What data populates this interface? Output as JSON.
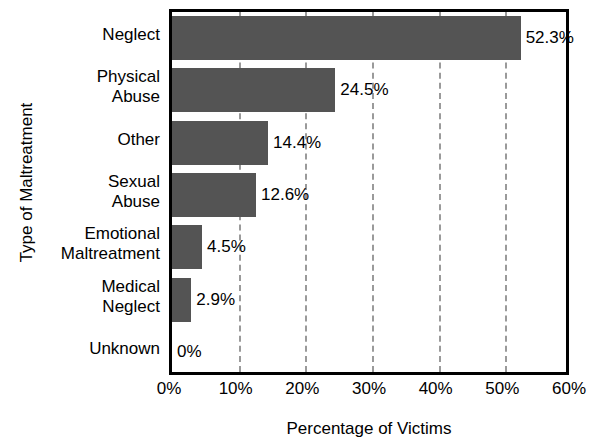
{
  "chart_data": {
    "type": "bar",
    "orientation": "horizontal",
    "title": "",
    "xlabel": "Percentage of Victims",
    "ylabel": "Type of Maltreatment",
    "categories": [
      "Neglect",
      "Physical Abuse",
      "Other",
      "Sexual Abuse",
      "Emotional Maltreatment",
      "Medical Neglect",
      "Unknown"
    ],
    "category_lines": [
      [
        "Neglect"
      ],
      [
        "Physical",
        "Abuse"
      ],
      [
        "Other"
      ],
      [
        "Sexual",
        "Abuse"
      ],
      [
        "Emotional",
        "Maltreatment"
      ],
      [
        "Medical",
        "Neglect"
      ],
      [
        "Unknown"
      ]
    ],
    "values": [
      52.3,
      24.5,
      14.4,
      12.6,
      4.5,
      2.9,
      0
    ],
    "value_labels": [
      "52.3%",
      "24.5%",
      "14.4%",
      "12.6%",
      "4.5%",
      "2.9%",
      "0%"
    ],
    "xlim": [
      0,
      60
    ],
    "xticks": [
      0,
      10,
      20,
      30,
      40,
      50,
      60
    ],
    "xtick_labels": [
      "0%",
      "10%",
      "20%",
      "30%",
      "40%",
      "50%",
      "60%"
    ],
    "grid": "vertical-dashed",
    "legend": "none",
    "bar_color": "#545454",
    "axis_color": "#000000",
    "gridline_color": "#9a9a9a",
    "background_color": "#ffffff"
  }
}
